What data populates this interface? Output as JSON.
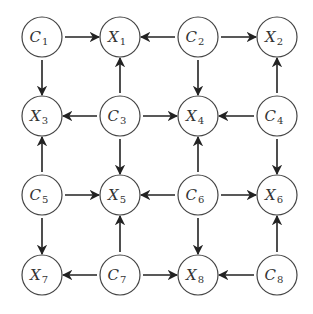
{
  "diagram": {
    "type": "directed-graph",
    "layout": "4x4 grid",
    "node_radius": 20,
    "columns_x": [
      42,
      120,
      198,
      277
    ],
    "rows_y": [
      37,
      116,
      195,
      275
    ],
    "colors": {
      "stroke": "#444444",
      "edge": "#222222",
      "text": "#333333",
      "background": "#ffffff"
    },
    "nodes": [
      {
        "id": "C1",
        "letter": "C",
        "sub": "1",
        "row": 0,
        "col": 0
      },
      {
        "id": "X1",
        "letter": "X",
        "sub": "1",
        "row": 0,
        "col": 1
      },
      {
        "id": "C2",
        "letter": "C",
        "sub": "2",
        "row": 0,
        "col": 2
      },
      {
        "id": "X2",
        "letter": "X",
        "sub": "2",
        "row": 0,
        "col": 3
      },
      {
        "id": "X3",
        "letter": "X",
        "sub": "3",
        "row": 1,
        "col": 0
      },
      {
        "id": "C3",
        "letter": "C",
        "sub": "3",
        "row": 1,
        "col": 1
      },
      {
        "id": "X4",
        "letter": "X",
        "sub": "4",
        "row": 1,
        "col": 2
      },
      {
        "id": "C4",
        "letter": "C",
        "sub": "4",
        "row": 1,
        "col": 3
      },
      {
        "id": "C5",
        "letter": "C",
        "sub": "5",
        "row": 2,
        "col": 0
      },
      {
        "id": "X5",
        "letter": "X",
        "sub": "5",
        "row": 2,
        "col": 1
      },
      {
        "id": "C6",
        "letter": "C",
        "sub": "6",
        "row": 2,
        "col": 2
      },
      {
        "id": "X6",
        "letter": "X",
        "sub": "6",
        "row": 2,
        "col": 3
      },
      {
        "id": "X7",
        "letter": "X",
        "sub": "7",
        "row": 3,
        "col": 0
      },
      {
        "id": "C7",
        "letter": "C",
        "sub": "7",
        "row": 3,
        "col": 1
      },
      {
        "id": "X8",
        "letter": "X",
        "sub": "8",
        "row": 3,
        "col": 2
      },
      {
        "id": "C8",
        "letter": "C",
        "sub": "8",
        "row": 3,
        "col": 3
      }
    ],
    "edges": [
      {
        "from": "C1",
        "to": "X1"
      },
      {
        "from": "C1",
        "to": "X3"
      },
      {
        "from": "C2",
        "to": "X1"
      },
      {
        "from": "C2",
        "to": "X2"
      },
      {
        "from": "C2",
        "to": "X4"
      },
      {
        "from": "C3",
        "to": "X1"
      },
      {
        "from": "C3",
        "to": "X3"
      },
      {
        "from": "C3",
        "to": "X4"
      },
      {
        "from": "C3",
        "to": "X5"
      },
      {
        "from": "C4",
        "to": "X2"
      },
      {
        "from": "C4",
        "to": "X4"
      },
      {
        "from": "C4",
        "to": "X6"
      },
      {
        "from": "C5",
        "to": "X3"
      },
      {
        "from": "C5",
        "to": "X5"
      },
      {
        "from": "C5",
        "to": "X7"
      },
      {
        "from": "C6",
        "to": "X4"
      },
      {
        "from": "C6",
        "to": "X5"
      },
      {
        "from": "C6",
        "to": "X6"
      },
      {
        "from": "C6",
        "to": "X8"
      },
      {
        "from": "C7",
        "to": "X5"
      },
      {
        "from": "C7",
        "to": "X7"
      },
      {
        "from": "C7",
        "to": "X8"
      },
      {
        "from": "C8",
        "to": "X6"
      },
      {
        "from": "C8",
        "to": "X8"
      }
    ]
  }
}
